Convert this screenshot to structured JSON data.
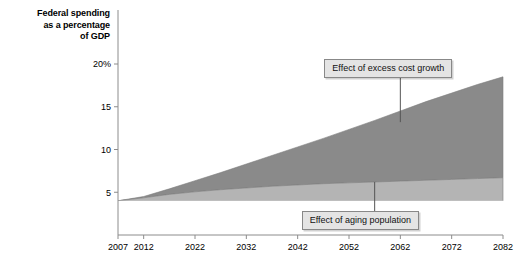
{
  "chart_data": {
    "type": "area",
    "title": "Federal spending as a percentage of GDP",
    "title_lines": [
      "Federal spending",
      "as a percentage",
      "of GDP"
    ],
    "xlabel": "",
    "ylabel": "Federal spending as a percentage of GDP",
    "xlim": [
      2007,
      2082
    ],
    "ylim": [
      0,
      21
    ],
    "grid": false,
    "legend_position": "annotated-callouts",
    "ytick_labels": [
      "20%",
      "15",
      "10",
      "5"
    ],
    "ytick_values": [
      20,
      15,
      10,
      5
    ],
    "xtick_labels": [
      "2007",
      "2012",
      "2022",
      "2032",
      "2042",
      "2052",
      "2062",
      "2072",
      "2082"
    ],
    "xtick_values": [
      2007,
      2012,
      2022,
      2032,
      2042,
      2052,
      2062,
      2072,
      2082
    ],
    "x": [
      2007,
      2012,
      2017,
      2022,
      2027,
      2032,
      2037,
      2042,
      2047,
      2052,
      2057,
      2062,
      2067,
      2072,
      2077,
      2082
    ],
    "series": [
      {
        "name": "Baseline spending (unshaded)",
        "color": "#ffffff",
        "values": [
          4.0,
          4.0,
          4.0,
          4.0,
          4.0,
          4.0,
          4.0,
          4.0,
          4.0,
          4.0,
          4.0,
          4.0,
          4.0,
          4.0,
          4.0,
          4.0
        ]
      },
      {
        "name": "Effect of aging population",
        "color": "#b4b4b4",
        "values": [
          4.0,
          4.35,
          4.75,
          5.05,
          5.3,
          5.5,
          5.7,
          5.85,
          6.0,
          6.1,
          6.2,
          6.3,
          6.4,
          6.5,
          6.6,
          6.7
        ]
      },
      {
        "name": "Effect of excess cost growth",
        "color": "#8a8a8a",
        "values": [
          4.0,
          4.5,
          5.4,
          6.35,
          7.3,
          8.3,
          9.3,
          10.3,
          11.3,
          12.35,
          13.4,
          14.5,
          15.6,
          16.6,
          17.6,
          18.5
        ]
      }
    ],
    "annotations": [
      {
        "id": "excess-cost-growth",
        "label": "Effect of excess cost growth",
        "anchor_x": 2062,
        "anchor_y": 13.2
      },
      {
        "id": "aging-population",
        "label": "Effect of aging population",
        "anchor_x": 2057,
        "anchor_y": 6.2
      }
    ],
    "colors": {
      "excess_cost_growth": "#8a8a8a",
      "aging_population": "#b4b4b4",
      "axis": "#808080",
      "callout_background": "#e4e4e4",
      "callout_border": "#888888",
      "text": "#000000",
      "background": "#ffffff"
    }
  }
}
